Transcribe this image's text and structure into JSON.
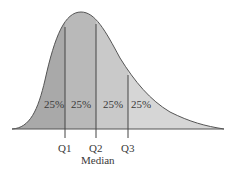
{
  "diagram": {
    "type": "skewed-distribution-quartiles",
    "regions": [
      {
        "label": "25%",
        "color": "#a9a9a9"
      },
      {
        "label": "25%",
        "color": "#b9b9b9"
      },
      {
        "label": "25%",
        "color": "#c9c9c9"
      },
      {
        "label": "25%",
        "color": "#d6d6d6"
      }
    ],
    "quartiles": [
      {
        "label": "Q1"
      },
      {
        "label": "Q2",
        "sublabel": "Median"
      },
      {
        "label": "Q3"
      }
    ],
    "outline_color": "#555555"
  }
}
